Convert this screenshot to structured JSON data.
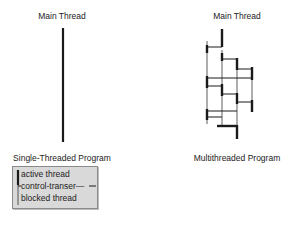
{
  "diagram": {
    "left": {
      "header": "Main Thread",
      "caption": "Single-Threaded Program"
    },
    "right": {
      "header": "Main Thread",
      "caption": "Multithreaded Program"
    },
    "legend": {
      "items": [
        {
          "label": "active thread",
          "style": "thick-line"
        },
        {
          "label": "control-transer—",
          "style": "horizontal-line"
        },
        {
          "label": "blocked thread",
          "style": "thin-line"
        }
      ]
    },
    "colors": {
      "line": "#1a1a1a",
      "legend_bg": "#d9d9d9",
      "legend_border": "#8a8a8a"
    }
  }
}
